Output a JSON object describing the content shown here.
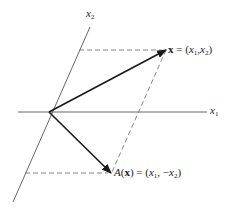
{
  "diagram": {
    "colors": {
      "axis": "#555555",
      "vector": "#1a1a1a",
      "dashed": "#777777",
      "text": "#1a1a1a"
    },
    "axes": {
      "x1": {
        "label_var": "x",
        "label_sub": "1"
      },
      "x2": {
        "label_var": "x",
        "label_sub": "2"
      }
    },
    "vectors": [
      {
        "id": "x",
        "label_lhs": "x",
        "label_eq": " = (",
        "comp1_var": "x",
        "comp1_sub": "1",
        "sep": ",",
        "comp2_prefix": "",
        "comp2_var": "x",
        "comp2_sub": "2",
        "close": ")"
      },
      {
        "id": "A(x)",
        "label_fn": "A",
        "label_open": "(",
        "label_arg": "x",
        "label_close": ")",
        "label_eq": " = (",
        "comp1_var": "x",
        "comp1_sub": "1",
        "sep": ", ",
        "comp2_prefix": "−",
        "comp2_var": "x",
        "comp2_sub": "2",
        "close": ")"
      }
    ]
  }
}
